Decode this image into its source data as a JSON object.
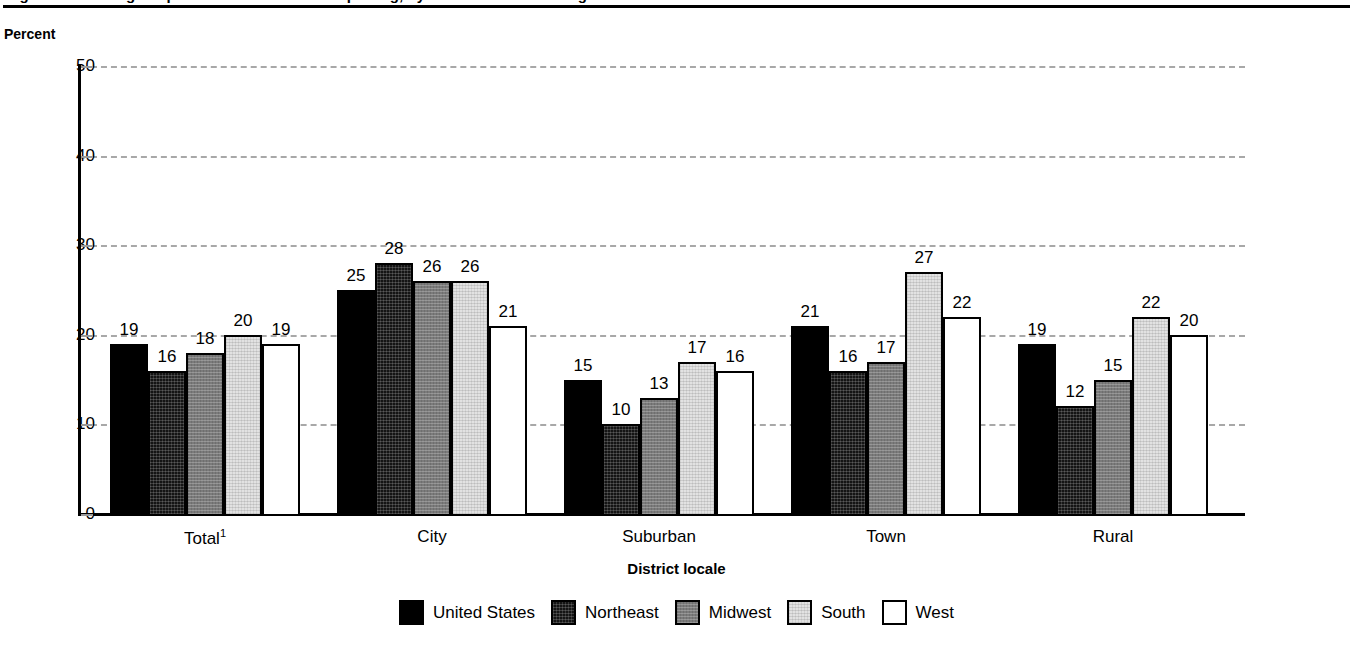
{
  "figure": {
    "title": "Figure: Percentage of public school districts reporting, by district locale and region",
    "ylabel": "Percent",
    "xaxis_title": "District locale"
  },
  "chart_data": {
    "type": "bar",
    "title": "Figure: Percentage of public school districts reporting, by district locale and region",
    "xlabel": "District locale",
    "ylabel": "Percent",
    "ylim": [
      0,
      50
    ],
    "yticks": [
      0,
      10,
      20,
      30,
      40,
      50
    ],
    "grid": true,
    "legend_position": "bottom",
    "categories": [
      "Total¹",
      "City",
      "Suburban",
      "Town",
      "Rural"
    ],
    "series": [
      {
        "name": "United States",
        "color": "#000000",
        "values": [
          19,
          25,
          15,
          21,
          19
        ]
      },
      {
        "name": "Northeast",
        "color": "#141414",
        "values": [
          16,
          28,
          10,
          16,
          12
        ]
      },
      {
        "name": "Midwest",
        "color": "#7b7b7b",
        "values": [
          18,
          26,
          13,
          17,
          15
        ]
      },
      {
        "name": "South",
        "color": "#e2e2e2",
        "values": [
          20,
          26,
          17,
          27,
          22
        ]
      },
      {
        "name": "West",
        "color": "#ffffff",
        "values": [
          19,
          21,
          16,
          22,
          20
        ]
      }
    ]
  },
  "ytick_labels": [
    "50",
    "40",
    "30",
    "20",
    "10",
    "0"
  ],
  "legend": [
    {
      "label": "United States",
      "fill": "f-us"
    },
    {
      "label": "Northeast",
      "fill": "f-ne"
    },
    {
      "label": "Midwest",
      "fill": "f-mw"
    },
    {
      "label": "South",
      "fill": "f-so"
    },
    {
      "label": "West",
      "fill": "f-we"
    }
  ]
}
